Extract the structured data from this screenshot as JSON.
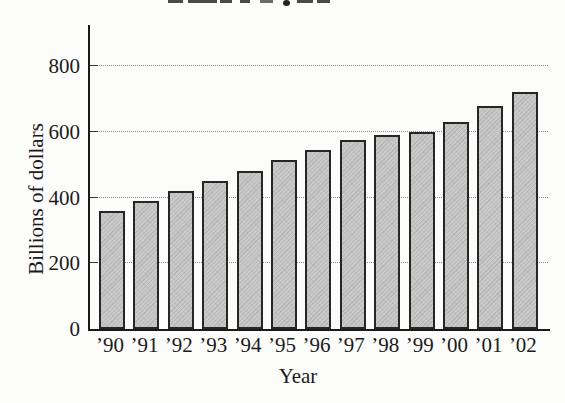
{
  "chart_data": {
    "type": "bar",
    "categories": [
      "’90",
      "’91",
      "’92",
      "’93",
      "’94",
      "’95",
      "’96",
      "’97",
      "’98",
      "’99",
      "’00",
      "’01",
      "’02"
    ],
    "values": [
      360,
      390,
      420,
      450,
      480,
      515,
      545,
      575,
      590,
      600,
      630,
      680,
      720
    ],
    "xlabel": "Year",
    "ylabel": "Billions of dollars",
    "ylim": [
      0,
      925
    ],
    "yticks": [
      0,
      200,
      400,
      600,
      800
    ],
    "grid": "horizontal dotted gridlines at each labeled y tick",
    "legend": "none",
    "colors": {
      "bar_fill": "#c9c9c9",
      "bar_border": "#262626",
      "axis": "#1a1a1a",
      "gridline": "#8d8d8d",
      "text": "#1b1b1b",
      "background": "#fcfcfb"
    }
  }
}
